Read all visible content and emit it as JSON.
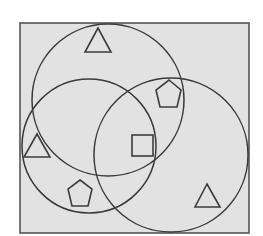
{
  "diagram": {
    "type": "venn-diagram",
    "colors": {
      "background": "#e2e2e2",
      "stroke": "#3a3a3a",
      "page": "#ffffff"
    },
    "frame": {
      "x": 20,
      "y": 23,
      "width": 229,
      "height": 210
    },
    "circles": [
      {
        "name": "top",
        "cx": 108,
        "cy": 100,
        "r": 76
      },
      {
        "name": "left",
        "cx": 89,
        "cy": 146,
        "r": 67
      },
      {
        "name": "right",
        "cx": 171,
        "cy": 155,
        "r": 77
      }
    ],
    "shapes": [
      {
        "kind": "triangle",
        "region": "top-only",
        "points": "98,28 85,52 111,52"
      },
      {
        "kind": "pentagon",
        "region": "top-and-right",
        "points": "169,80 181,90 177,107 160,107 156,90"
      },
      {
        "kind": "square",
        "region": "top-left-right",
        "x": 132,
        "y": 135,
        "size": 21
      },
      {
        "kind": "triangle",
        "region": "left-edge-outside-right",
        "points": "37,134 24,157 50,157"
      },
      {
        "kind": "pentagon",
        "region": "left-and-right",
        "points": "80,180 92,189 88,206 72,206 68,189"
      },
      {
        "kind": "triangle",
        "region": "right-only",
        "points": "207,184 195,207 220,207"
      }
    ]
  }
}
